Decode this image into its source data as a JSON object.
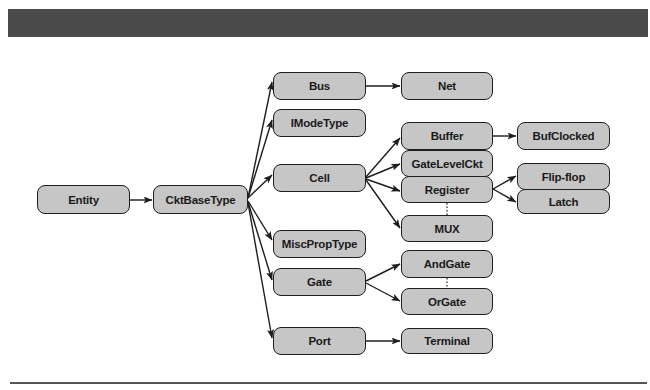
{
  "header_bar": {
    "color": "#4a4a4a"
  },
  "diagram": {
    "title": "",
    "nodes": {
      "entity": "Entity",
      "cktbasetype": "CktBaseType",
      "bus": "Bus",
      "imodetype": "IModeType",
      "cell": "Cell",
      "miscproptype": "MiscPropType",
      "gate": "Gate",
      "port": "Port",
      "net": "Net",
      "buffer": "Buffer",
      "gatelevelckt": "GateLevelCkt",
      "register": "Register",
      "mux": "MUX",
      "andgate": "AndGate",
      "orgate": "OrGate",
      "terminal": "Terminal",
      "bufclocked": "BufClocked",
      "flipflop": "Flip-flop",
      "latch": "Latch"
    },
    "edges": [
      [
        "Entity",
        "CktBaseType"
      ],
      [
        "CktBaseType",
        "Bus"
      ],
      [
        "CktBaseType",
        "IModeType"
      ],
      [
        "CktBaseType",
        "Cell"
      ],
      [
        "CktBaseType",
        "MiscPropType"
      ],
      [
        "CktBaseType",
        "Gate"
      ],
      [
        "CktBaseType",
        "Port"
      ],
      [
        "Bus",
        "Net"
      ],
      [
        "Cell",
        "Buffer"
      ],
      [
        "Cell",
        "GateLevelCkt"
      ],
      [
        "Cell",
        "Register"
      ],
      [
        "Cell",
        "MUX"
      ],
      [
        "Buffer",
        "BufClocked"
      ],
      [
        "Register",
        "Flip-flop"
      ],
      [
        "Register",
        "Latch"
      ],
      [
        "Gate",
        "AndGate"
      ],
      [
        "Gate",
        "OrGate"
      ],
      [
        "Port",
        "Terminal"
      ]
    ],
    "ellipsis_links": [
      [
        "Register",
        "MUX"
      ],
      [
        "AndGate",
        "OrGate"
      ]
    ],
    "colors": {
      "node_fill": "#c6c6c6",
      "node_border": "#1e1e1e",
      "edge": "#1e1e1e"
    }
  }
}
